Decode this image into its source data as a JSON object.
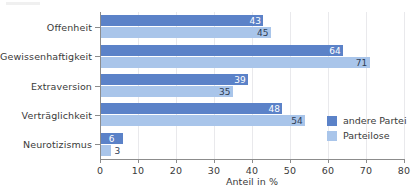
{
  "chart_data": {
    "type": "bar",
    "orientation": "horizontal",
    "title": "",
    "xlabel": "Anteil in %",
    "ylabel": "",
    "xlim": [
      0,
      80
    ],
    "xticks": [
      0,
      10,
      20,
      30,
      40,
      50,
      60,
      70,
      80
    ],
    "xtick_labels": [
      "0",
      "10",
      "20",
      "30",
      "40",
      "50",
      "60",
      "70",
      "80"
    ],
    "grid": true,
    "grid_axis": "x",
    "legend_position": "center-right",
    "categories": [
      "Offenheit",
      "Gewissenhaftigkeit",
      "Extraversion",
      "Verträglichkeit",
      "Neurotizismus"
    ],
    "series": [
      {
        "name": "andere Partei",
        "color": "#5b82c8",
        "values": [
          43,
          64,
          39,
          48,
          6
        ],
        "labels": [
          "43",
          "64",
          "39",
          "48",
          "6"
        ]
      },
      {
        "name": "Parteilose",
        "color": "#a9c5ea",
        "values": [
          45,
          71,
          35,
          54,
          3
        ],
        "labels": [
          "45",
          "71",
          "35",
          "54",
          "3"
        ]
      }
    ]
  },
  "colors": {
    "series_dark": "#5b82c8",
    "series_light": "#a9c5ea",
    "axis": "#8c8c8c",
    "grid": "#e9e9ec",
    "text": "#3a3a3a",
    "value_text": "#2e3d55",
    "value_text_inverse": "#ffffff",
    "background": "#ffffff"
  }
}
